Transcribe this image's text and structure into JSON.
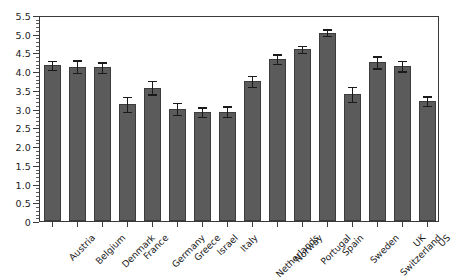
{
  "chart_data": {
    "type": "bar",
    "title": "",
    "subtitle": "",
    "xlabel": "",
    "ylabel": "",
    "ylim": [
      0,
      5.5
    ],
    "ytick_step": 0.5,
    "yminor_step": 0.1,
    "grid": false,
    "legend": null,
    "error_bars": "symmetric",
    "bar_color": "#5b5b5b",
    "bar_edge_color": "#3c3c3c",
    "axis_color": "#3a3a3a",
    "text_color": "#1c1c1c",
    "ytick_labels": [
      "0",
      "0.5",
      "1.0",
      "1.5",
      "2.0",
      "2.5",
      "3.0",
      "3.5",
      "4.0",
      "4.5",
      "5.0",
      "5.5"
    ],
    "ytick_values": [
      0,
      0.5,
      1.0,
      1.5,
      2.0,
      2.5,
      3.0,
      3.5,
      4.0,
      4.5,
      5.0,
      5.5
    ],
    "categories": [
      "Austria",
      "Belgium",
      "Denmark",
      "France",
      "Germany",
      "Greece",
      "Israel",
      "Italy",
      "Netherlands",
      "Norway",
      "Portugal",
      "Spain",
      "Sweden",
      "Switzerland",
      "UK",
      "US"
    ],
    "values": [
      4.16,
      4.12,
      4.1,
      3.12,
      3.56,
      3.0,
      2.91,
      2.92,
      3.73,
      4.32,
      4.58,
      5.03,
      3.39,
      4.24,
      4.14,
      3.2
    ],
    "errors": [
      0.12,
      0.17,
      0.14,
      0.2,
      0.18,
      0.16,
      0.13,
      0.14,
      0.15,
      0.13,
      0.09,
      0.09,
      0.2,
      0.16,
      0.14,
      0.13
    ]
  }
}
